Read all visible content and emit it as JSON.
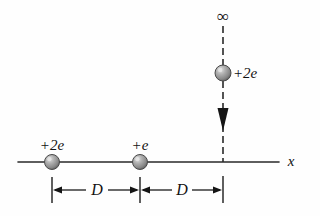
{
  "figure": {
    "background_color": "#fefefe",
    "line_color": "#2a2a2a",
    "sphere_color": "#8f8f8f",
    "sphere_rim_color": "#4a4a4a",
    "sphere_highlight_color": "#d8d8d8"
  },
  "axis": {
    "name": "x-axis",
    "label": "x",
    "label_x": 291,
    "label_y": 161,
    "line_y": 162,
    "line_x_start": 18,
    "line_x_end": 279
  },
  "charges": [
    {
      "id": "charge-left",
      "label": "+2e",
      "label_x": 52,
      "label_y": 145,
      "cx": 52,
      "cy": 162,
      "r": 7.5,
      "on_axis": true,
      "label_anchor": "center"
    },
    {
      "id": "charge-middle",
      "label": "+e",
      "label_x": 140,
      "label_y": 145,
      "cx": 140,
      "cy": 162,
      "r": 7.5,
      "on_axis": true,
      "label_anchor": "center"
    },
    {
      "id": "charge-moving",
      "label": "+2e",
      "label_x": 233,
      "label_y": 73,
      "cx": 223,
      "cy": 73,
      "r": 8,
      "on_axis": false,
      "label_anchor": "left"
    }
  ],
  "trajectory": {
    "name": "dashed-trajectory",
    "x": 223,
    "y_start": 26,
    "y_end": 162,
    "dash_length": 7,
    "gap_length": 4,
    "infinity_symbol": "∞",
    "infinity_x": 223,
    "infinity_y": 16,
    "arrow_tip_y": 131,
    "arrow_base_y": 108,
    "arrow_half_width": 5.5,
    "direction": "down"
  },
  "dimensions": [
    {
      "id": "dimension-left",
      "label": "D",
      "label_x": 97,
      "label_y": 190,
      "x_start": 52,
      "x_end": 140,
      "y": 190
    },
    {
      "id": "dimension-right",
      "label": "D",
      "label_x": 182,
      "label_y": 190,
      "x_start": 140,
      "x_end": 223,
      "y": 190
    }
  ],
  "dimension_ticks": [
    {
      "id": "tick-left",
      "x": 52,
      "y_top": 177,
      "y_bottom": 203
    },
    {
      "id": "tick-middle",
      "x": 140,
      "y_top": 177,
      "y_bottom": 203
    },
    {
      "id": "tick-right",
      "x": 223,
      "y_top": 176,
      "y_bottom": 203
    }
  ]
}
